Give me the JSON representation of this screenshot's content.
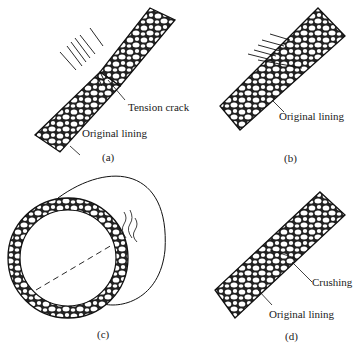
{
  "figure": {
    "panels": [
      {
        "id": "a",
        "caption": "(a)",
        "labels": [
          "Tension crack",
          "Original lining"
        ]
      },
      {
        "id": "b",
        "caption": "(b)",
        "labels": [
          "Original lining"
        ]
      },
      {
        "id": "c",
        "caption": "(c)",
        "labels": []
      },
      {
        "id": "d",
        "caption": "(d)",
        "labels": [
          "Crushing",
          "Original lining"
        ]
      }
    ]
  }
}
